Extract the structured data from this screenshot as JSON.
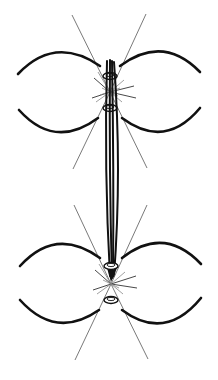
{
  "diagram": {
    "type": "mitotic-spindle-illustration",
    "background": "#ffffff",
    "stroke_color": "#111111",
    "ray_color": "#6a6a6a",
    "poles": [
      {
        "name": "top-pole",
        "center": [
          110,
          92
        ],
        "rings_y": [
          75,
          108
        ]
      },
      {
        "name": "bottom-pole",
        "center": [
          111,
          284
        ],
        "rings_y": [
          266,
          300
        ]
      }
    ],
    "fiber_bundle": {
      "from": [
        110,
        62
      ],
      "to": [
        112,
        280
      ],
      "count": 4
    }
  }
}
